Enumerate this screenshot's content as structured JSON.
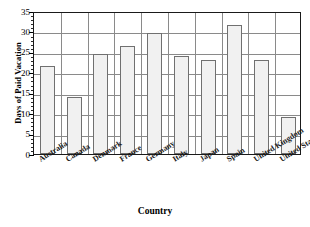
{
  "chart_data": {
    "type": "bar",
    "title": "",
    "xlabel": "Country",
    "ylabel": "Days of Paid Vacation",
    "categories": [
      "Australia",
      "Canada",
      "Denmark",
      "France",
      "Germany",
      "Italy",
      "Japan",
      "Spain",
      "United Kingdom",
      "United States"
    ],
    "values": [
      21.5,
      14,
      24.5,
      26.5,
      29.5,
      24,
      23,
      31.5,
      23,
      9
    ],
    "ylim": [
      0,
      35
    ],
    "ytick_labels": [
      "0",
      "5",
      "10",
      "15",
      "20",
      "25",
      "30",
      "35"
    ],
    "ytick_values": [
      0,
      5,
      10,
      15,
      20,
      25,
      30,
      35
    ],
    "ytick_minor_step": 1,
    "grid": "horizontal-and-vertical",
    "legend": "none",
    "bar_fill_color": "#f1f1f1",
    "bar_border_color": "#707070",
    "gridline_color": "#8a8a8a",
    "frame_color": "#1a1a1a"
  }
}
